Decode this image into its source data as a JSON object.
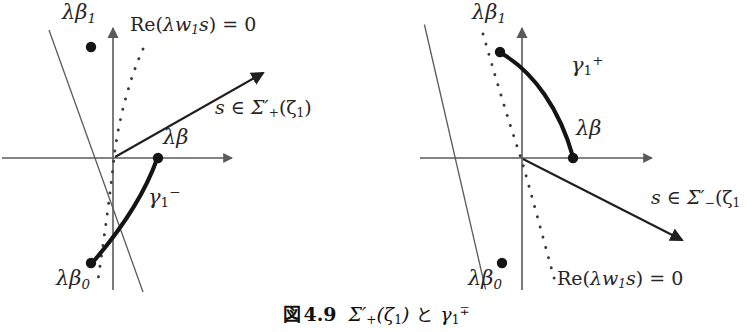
{
  "figure": {
    "caption": {
      "fig_word": "図",
      "number": "4.9",
      "sigma_expr": "Σ′",
      "sigma_sub": "+",
      "sigma_arg": "(ζ",
      "sigma_arg_sub": "1",
      "sigma_arg_close": ")",
      "conj": "と",
      "gamma": "γ",
      "gamma_sub": "1",
      "gamma_sup": "∓",
      "full_text": "図 4.9  Σ′₊(ζ₁) と γ₁∓"
    },
    "stroke_color": "#262626",
    "thin_color": "#5a5a5a",
    "background": "#ffffff"
  },
  "left_panel": {
    "name": "sigma-plus-gamma-minus-diagram",
    "origin": {
      "x": 113,
      "y": 158
    },
    "labels": {
      "lambda_beta_1": {
        "base": "λβ",
        "sub": "1",
        "x": 64,
        "y": 4
      },
      "lambda_beta_0": {
        "base": "λβ",
        "sub": "0",
        "x": 59,
        "y": 272
      },
      "lambda_beta": {
        "base": "λβ",
        "x": 164,
        "y": 131
      },
      "re_condition": {
        "text_pre": "Re(",
        "lam": "λw",
        "sub": "1",
        "s": "s",
        "post": ") = 0",
        "x": 131,
        "y": 16
      },
      "sector": {
        "s": "s",
        "in": "∈",
        "sigma": "Σ′",
        "sub": "+",
        "arg": "(ζ",
        "argsub": "1",
        "close": ")",
        "x": 216,
        "y": 99
      },
      "gamma": {
        "base": "γ",
        "sub": "1",
        "sup": "−",
        "x": 150,
        "y": 190
      }
    },
    "dots": [
      {
        "name": "lambda-beta-1-point",
        "x": 91,
        "y": 47,
        "r": 5
      },
      {
        "name": "lambda-beta-point",
        "x": 158,
        "y": 158,
        "r": 5
      },
      {
        "name": "lambda-beta-0-point",
        "x": 91,
        "y": 263,
        "r": 5
      }
    ],
    "axes": {
      "horizontal": {
        "x1": 2,
        "y1": 158,
        "x2": 238,
        "y2": 158
      },
      "vertical": {
        "x1": 113,
        "y1": 290,
        "x2": 113,
        "y2": 22
      }
    },
    "thin_ray": {
      "x1": 49,
      "y1": 30,
      "x2": 142,
      "y2": 290
    },
    "sector_arrow": {
      "x1": 113,
      "y1": 158,
      "x2": 262,
      "y2": 74
    },
    "dotted_curve_desc": "dotted line through origin curving from upper-right to lower-left",
    "gamma_curve_desc": "thick arc from lambda-beta point on real axis down-left to lambda-beta-0 point"
  },
  "right_panel": {
    "name": "sigma-minus-gamma-plus-diagram",
    "origin": {
      "x": 522,
      "y": 158
    },
    "labels": {
      "lambda_beta_1": {
        "base": "λβ",
        "sub": "1",
        "x": 473,
        "y": 4
      },
      "lambda_beta_0": {
        "base": "λβ",
        "sub": "0",
        "x": 470,
        "y": 272
      },
      "lambda_beta": {
        "base": "λβ",
        "x": 577,
        "y": 122
      },
      "re_condition": {
        "text_pre": "Re(",
        "lam": "λw",
        "sub": "1",
        "s": "s",
        "post": ") = 0",
        "x": 558,
        "y": 270
      },
      "sector": {
        "s": "s",
        "in": "∈",
        "sigma": "Σ′",
        "sub": "−",
        "arg": "(ζ",
        "argsub": "1",
        "close": "",
        "x": 653,
        "y": 189
      },
      "gamma": {
        "base": "γ",
        "sub": "1",
        "sup": "+",
        "x": 572,
        "y": 58
      }
    },
    "dots": [
      {
        "name": "lambda-beta-1-point",
        "x": 500,
        "y": 52,
        "r": 5
      },
      {
        "name": "lambda-beta-point",
        "x": 573,
        "y": 158,
        "r": 5
      },
      {
        "name": "lambda-beta-0-point",
        "x": 502,
        "y": 263,
        "r": 5
      }
    ],
    "axes": {
      "horizontal": {
        "x1": 420,
        "y1": 158,
        "x2": 658,
        "y2": 158
      },
      "vertical": {
        "x1": 522,
        "y1": 290,
        "x2": 522,
        "y2": 22
      }
    },
    "thin_ray": {
      "x1": 455,
      "y1": 22,
      "x2": 455,
      "y2": 290
    },
    "sector_arrow": {
      "x1": 522,
      "y1": 158,
      "x2": 680,
      "y2": 238
    },
    "dotted_curve_desc": "dotted line through origin curving from upper-left to lower-right",
    "gamma_curve_desc": "thick arc from lambda-beta-1 point down-right to lambda-beta point on real axis"
  }
}
